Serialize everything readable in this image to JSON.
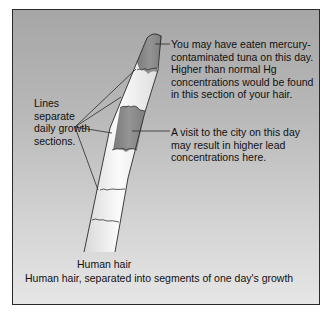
{
  "diagram": {
    "title": "Human hair, separated into segments of one day's growth",
    "subject_label": "Human hair",
    "annotations": {
      "mercury": "You may have eaten mercury-contaminated tuna on this day. Higher than normal Hg concentrations would be found in this section of your hair.",
      "lead": "A visit to the city on this day may result in higher lead concentrations here.",
      "lines": "Lines separate daily growth sections."
    },
    "colors": {
      "background_top": "#a6a6a6",
      "background_bottom": "#e6e6e6",
      "hair_light": "#f2f2f2",
      "hair_dark_segment": "#8a8a8a",
      "outline": "#2a2a2a"
    }
  }
}
